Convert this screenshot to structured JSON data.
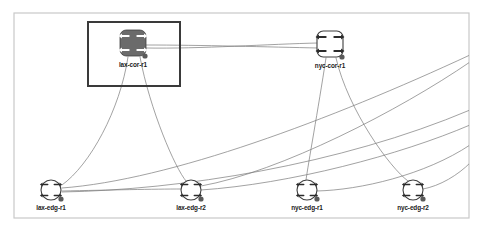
{
  "app": {
    "title": "Network Topology",
    "canvas": {
      "background_color": "#ffffff",
      "border_color": "#c9c9c9",
      "x": 14,
      "y": 13,
      "width": 455,
      "height": 205
    }
  },
  "selection": {
    "name": "selection-rectangle",
    "selected_node": "lax-cor-r1",
    "border_color": "#3a3a3a",
    "x": 88,
    "y": 22,
    "width": 92,
    "height": 64
  },
  "styles": {
    "link_color": "#7a7a7a",
    "node_stroke": "#3f3f3f",
    "node_fill_core_selected": "#6b6b6b",
    "node_fill_default": "#ffffff",
    "endpoint_dot_color": "#5a5a5a",
    "label_color": "#1a1a1a",
    "arrow_glyph_color_dark": "#ffffff",
    "arrow_glyph_color_light": "#2b2b2b"
  },
  "nodes": [
    {
      "id": "lax-cor-r1",
      "label": "lax-cor-r1",
      "role": "core",
      "shape": "rounded-square",
      "icon": "router-icon",
      "x": 133,
      "y": 43,
      "size": 26,
      "selected": true,
      "fill": "#6b6b6b",
      "glyph_color": "#ffffff",
      "label_x": 133,
      "label_y": 65,
      "dot_x": 145,
      "dot_y": 56
    },
    {
      "id": "nyc-cor-r1",
      "label": "nyc-cor-r1",
      "role": "core",
      "shape": "rounded-square",
      "icon": "router-icon",
      "x": 330,
      "y": 44,
      "size": 26,
      "selected": false,
      "fill": "#ffffff",
      "glyph_color": "#2b2b2b",
      "label_x": 330,
      "label_y": 66,
      "dot_x": 342,
      "dot_y": 57
    },
    {
      "id": "lax-edg-r1",
      "label": "lax-edg-r1",
      "role": "edge",
      "shape": "circle",
      "icon": "router-icon",
      "x": 51,
      "y": 190,
      "size": 20,
      "selected": false,
      "fill": "#ffffff",
      "glyph_color": "#2b2b2b",
      "label_x": 51,
      "label_y": 208,
      "dot_x": 61,
      "dot_y": 199
    },
    {
      "id": "lax-edg-r2",
      "label": "lax-edg-r2",
      "role": "edge",
      "shape": "circle",
      "icon": "router-icon",
      "x": 191,
      "y": 190,
      "size": 20,
      "selected": false,
      "fill": "#ffffff",
      "glyph_color": "#2b2b2b",
      "label_x": 191,
      "label_y": 208,
      "dot_x": 201,
      "dot_y": 199
    },
    {
      "id": "nyc-edg-r1",
      "label": "nyc-edg-r1",
      "role": "edge",
      "shape": "circle",
      "icon": "router-icon",
      "x": 307,
      "y": 190,
      "size": 20,
      "selected": false,
      "fill": "#ffffff",
      "glyph_color": "#2b2b2b",
      "label_x": 307,
      "label_y": 208,
      "dot_x": 317,
      "dot_y": 199
    },
    {
      "id": "nyc-edg-r2",
      "label": "nyc-edg-r2",
      "role": "edge",
      "shape": "circle",
      "icon": "router-icon",
      "x": 413,
      "y": 190,
      "size": 20,
      "selected": false,
      "fill": "#ffffff",
      "glyph_color": "#2b2b2b",
      "label_x": 413,
      "label_y": 208,
      "dot_x": 423,
      "dot_y": 199
    }
  ],
  "links": [
    {
      "id": "link-laxcor-nyccor-a",
      "from": "lax-cor-r1",
      "to": "nyc-cor-r1",
      "path": "M146,45 C200,45 270,47 318,48"
    },
    {
      "id": "link-laxcor-nyccor-b",
      "from": "lax-cor-r1",
      "to": "nyc-cor-r1",
      "path": "M146,48 C200,49 270,44 318,43"
    },
    {
      "id": "link-laxcor-laxedgr1",
      "from": "lax-cor-r1",
      "to": "lax-edg-r1",
      "path": "M128,57 C120,110 90,165 62,185"
    },
    {
      "id": "link-laxcor-laxedgr2",
      "from": "lax-cor-r1",
      "to": "lax-edg-r2",
      "path": "M140,57 C150,110 175,168 186,181"
    },
    {
      "id": "link-nyccor-nycedgr1",
      "from": "nyc-cor-r1",
      "to": "nyc-edg-r1",
      "path": "M326,58 C318,110 308,165 306,180"
    },
    {
      "id": "link-nyccor-nycedgr2",
      "from": "nyc-cor-r1",
      "to": "nyc-edg-r2",
      "path": "M336,58 C348,110 390,168 408,181"
    },
    {
      "id": "link-laxedgr1-laxedgr2",
      "from": "lax-edg-r1",
      "to": "lax-edg-r2",
      "path": "M62,191 C110,190 155,189 181,189"
    },
    {
      "id": "link-laxedgr1-right-a",
      "from": "lax-edg-r1",
      "to": "nyc-cor-r1",
      "path": "M62,188 C170,180 330,120 470,55"
    },
    {
      "id": "link-laxedgr2-right-a",
      "from": "lax-edg-r2",
      "to": "nyc-cor-r1",
      "path": "M201,186 C280,172 400,110 470,62"
    },
    {
      "id": "link-laxedgr1-right-b",
      "from": "lax-edg-r1",
      "to": "nyc-edg-r2",
      "path": "M62,192 C180,190 340,165 470,110"
    },
    {
      "id": "link-laxedgr2-right-b",
      "from": "lax-edg-r2",
      "to": "nyc-edg-r2",
      "path": "M201,190 C290,184 400,155 470,125"
    },
    {
      "id": "link-nycedgr1-right",
      "from": "nyc-edg-r1",
      "to": "nyc-edg-r2",
      "path": "M317,191 C360,190 425,175 470,145"
    },
    {
      "id": "link-nycedgr2-right",
      "from": "nyc-edg-r2",
      "to": "edge-right",
      "path": "M423,189 C440,186 458,175 470,163"
    }
  ]
}
